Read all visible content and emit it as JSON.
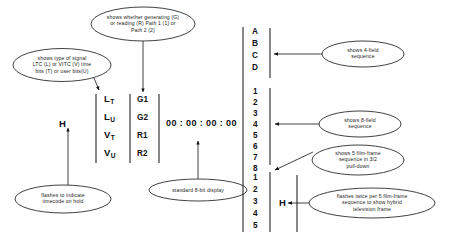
{
  "diagram": {
    "ink_color": "#111111"
  },
  "display": {
    "hold_indicator": "H",
    "signal_type_column": [
      {
        "main": "L",
        "sub": "T"
      },
      {
        "main": "L",
        "sub": "U"
      },
      {
        "main": "V",
        "sub": "T"
      },
      {
        "main": "V",
        "sub": "U"
      }
    ],
    "mode_column": [
      "G1",
      "G2",
      "R1",
      "R2"
    ],
    "timecode": "00 : 00 : 00 : 00"
  },
  "sequences": {
    "four_field": [
      "A",
      "B",
      "C",
      "D"
    ],
    "eight_field": [
      "1",
      "2",
      "3",
      "4",
      "5",
      "6",
      "7",
      "8"
    ],
    "film_frame": [
      "1",
      "2",
      "3",
      "4",
      "5"
    ],
    "hybrid_flag": "H"
  },
  "callouts": {
    "generating_reading": "shows whether generating (G)\nor reading (R) Path 1 (1) or\nPath 2 (2)",
    "signal_type": "shows type of signal\nLTC (L) or VITC (V) time\nbits (T) or user bits(U)",
    "hold_flash": "flashes to indicate\ntimecode on hold",
    "eight_bit_display": "standard 8-bit display",
    "four_field": "shows 4-field\nsequence",
    "eight_field": "shows 8-field\nsequence",
    "film_frame": "shows 5 film-frame\nsequence in 3/2\npull-down",
    "hybrid_frame": "flashes twice per 5 film-frame\nsequence to show hybrid\ntelevision frame"
  }
}
